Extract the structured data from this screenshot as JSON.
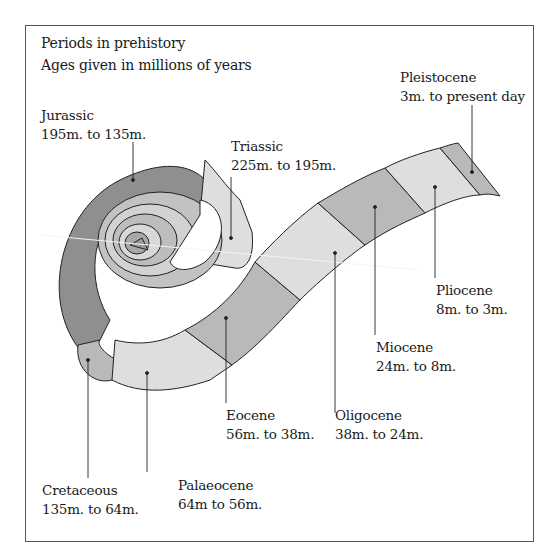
{
  "header": {
    "title": "Periods in prehistory",
    "subtitle": "Ages given in millions of years"
  },
  "colors": {
    "dark": "#8f8f8f",
    "mid": "#b9b9b9",
    "light": "#dedede",
    "outline": "#222222",
    "background": "#ffffff"
  },
  "periods": [
    {
      "name": "Jurassic",
      "range": "195m. to 135m.",
      "shade": "dark"
    },
    {
      "name": "Triassic",
      "range": "225m. to 195m.",
      "shade": "light"
    },
    {
      "name": "Cretaceous",
      "range": "135m. to 64m.",
      "shade": "mid"
    },
    {
      "name": "Palaeocene",
      "range": "64m to 56m.",
      "shade": "light"
    },
    {
      "name": "Eocene",
      "range": "56m. to 38m.",
      "shade": "mid"
    },
    {
      "name": "Oligocene",
      "range": "38m. to 24m.",
      "shade": "light"
    },
    {
      "name": "Miocene",
      "range": "24m. to 8m.",
      "shade": "mid"
    },
    {
      "name": "Pliocene",
      "range": "8m. to 3m.",
      "shade": "light"
    },
    {
      "name": "Pleistocene",
      "range": "3m. to present day",
      "shade": "mid"
    }
  ]
}
